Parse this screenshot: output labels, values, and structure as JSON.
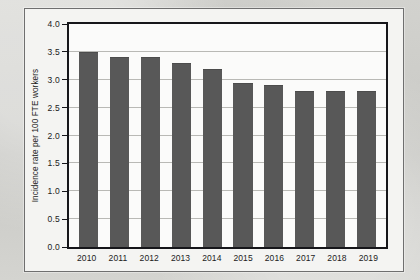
{
  "chart_data": {
    "type": "bar",
    "title": "",
    "xlabel": "",
    "ylabel": "Incidence rate per 100 FTE workers",
    "categories": [
      "2010",
      "2011",
      "2012",
      "2013",
      "2014",
      "2015",
      "2016",
      "2017",
      "2018",
      "2019"
    ],
    "values": [
      3.5,
      3.4,
      3.4,
      3.3,
      3.2,
      2.95,
      2.9,
      2.8,
      2.8,
      2.8
    ],
    "ylim": [
      0.0,
      4.0
    ],
    "ytick_values": [
      0.0,
      0.5,
      1.0,
      1.5,
      2.0,
      2.5,
      3.0,
      3.5,
      4.0
    ],
    "ytick_labels": [
      "0.0",
      "0.5",
      "1.0",
      "1.5",
      "2.0",
      "2.5",
      "3.0",
      "3.5",
      "4.0"
    ],
    "grid": true,
    "legend": "none",
    "series": [
      {
        "name": "Incidence rate",
        "color": "#585858",
        "values": [
          3.5,
          3.4,
          3.4,
          3.3,
          3.2,
          2.95,
          2.9,
          2.8,
          2.8,
          2.8
        ]
      }
    ]
  },
  "colors": {
    "bar": "#585858",
    "axis": "#16161a",
    "grid": "#b9b9b5",
    "plot_background": "#fbfbfa",
    "page_background": "#cfcfcb"
  }
}
